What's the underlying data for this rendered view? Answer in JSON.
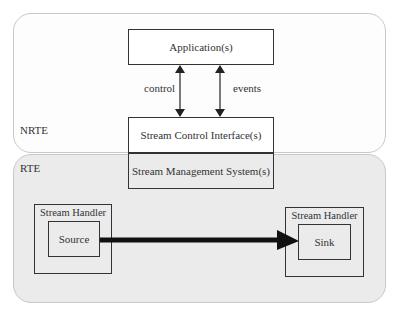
{
  "regions": {
    "nrte": {
      "label": "NRTE"
    },
    "rte": {
      "label": "RTE"
    }
  },
  "components": {
    "application": "Application(s)",
    "stream_control_interface": "Stream Control Interface(s)",
    "stream_management_system": "Stream Management System(s)",
    "source_handler": {
      "label": "Stream Handler",
      "inner": "Source"
    },
    "sink_handler": {
      "label": "Stream Handler",
      "inner": "Sink"
    }
  },
  "edges": {
    "control": "control",
    "events": "events"
  }
}
